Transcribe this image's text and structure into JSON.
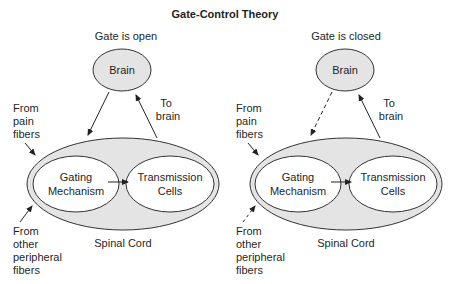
{
  "title": "Gate-Control Theory",
  "colors": {
    "background": "#ffffff",
    "fill": "#e4e4e4",
    "stroke": "#333333",
    "text": "#1f1f1f"
  },
  "panels": [
    {
      "state_label": "Gate is open",
      "brain_label": "Brain",
      "to_brain_label": [
        "To",
        "brain"
      ],
      "pain_fibers_label": [
        "From",
        "pain",
        "fibers"
      ],
      "peripheral_label": [
        "From",
        "other",
        "peripheral",
        "fibers"
      ],
      "gating_label": [
        "Gating",
        "Mechanism"
      ],
      "transmission_label": [
        "Transmission",
        "Cells"
      ],
      "spinal_cord_label": "Spinal Cord",
      "brain_to_cord_arrow": "solid",
      "peripheral_arrow": "solid"
    },
    {
      "state_label": "Gate is closed",
      "brain_label": "Brain",
      "to_brain_label": [
        "To",
        "brain"
      ],
      "pain_fibers_label": [
        "From",
        "pain",
        "fibers"
      ],
      "peripheral_label": [
        "From",
        "other",
        "peripheral",
        "fibers"
      ],
      "gating_label": [
        "Gating",
        "Mechanism"
      ],
      "transmission_label": [
        "Transmission",
        "Cells"
      ],
      "spinal_cord_label": "Spinal Cord",
      "brain_to_cord_arrow": "dashed",
      "peripheral_arrow": "dashed"
    }
  ]
}
